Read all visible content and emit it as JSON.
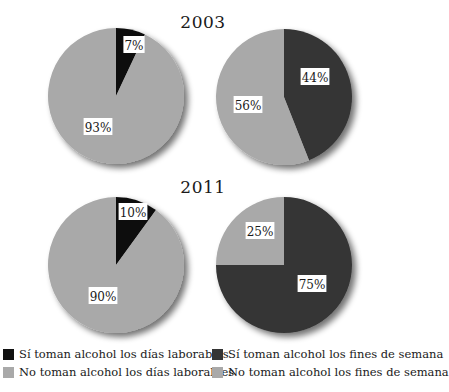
{
  "titles": {
    "top": "2003",
    "bottom": "2011"
  },
  "colors": {
    "si_laborables": "#111111",
    "no_laborables": "#a9a9a9",
    "si_fines": "#353535",
    "no_fines": "#a9a9a9"
  },
  "legend": {
    "left": [
      {
        "label": "Sí toman alcohol los días laborables",
        "color": "#111111"
      },
      {
        "label": "No toman alcohol los días laborables",
        "color": "#a9a9a9"
      }
    ],
    "right": [
      {
        "label": "Sí toman alcohol los fines de semana",
        "color": "#353535"
      },
      {
        "label": "No toman alcohol los fines de semana",
        "color": "#a9a9a9"
      }
    ]
  },
  "labels": {
    "p2003_lab_si": "7%",
    "p2003_lab_no": "93%",
    "p2003_fin_si": "44%",
    "p2003_fin_no": "56%",
    "p2011_lab_si": "10%",
    "p2011_lab_no": "90%",
    "p2011_fin_si": "75%",
    "p2011_fin_no": "25%"
  },
  "chart_data": [
    {
      "type": "pie",
      "title": "2003 — días laborables",
      "categories": [
        "Sí toman alcohol los días laborables",
        "No toman alcohol los días laborables"
      ],
      "values": [
        7,
        93
      ]
    },
    {
      "type": "pie",
      "title": "2003 — fines de semana",
      "categories": [
        "Sí toman alcohol los fines de semana",
        "No toman alcohol los fines de semana"
      ],
      "values": [
        44,
        56
      ]
    },
    {
      "type": "pie",
      "title": "2011 — días laborables",
      "categories": [
        "Sí toman alcohol los días laborables",
        "No toman alcohol los días laborables"
      ],
      "values": [
        10,
        90
      ]
    },
    {
      "type": "pie",
      "title": "2011 — fines de semana",
      "categories": [
        "Sí toman alcohol los fines de semana",
        "No toman alcohol los fines de semana"
      ],
      "values": [
        75,
        25
      ]
    }
  ]
}
